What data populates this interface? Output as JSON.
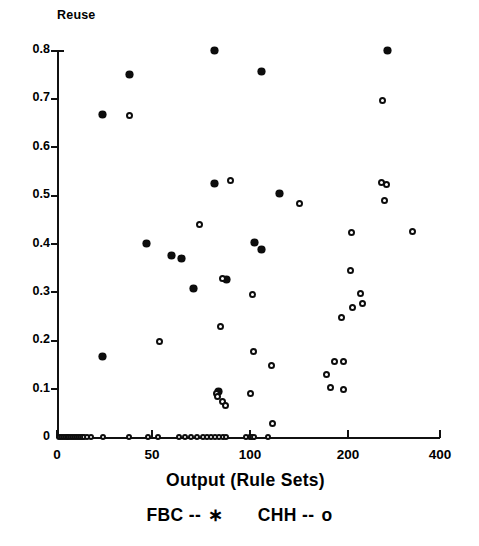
{
  "chart_data": {
    "type": "scatter",
    "title": "",
    "ylabel": "Reuse",
    "xlabel": "Output (Rule Sets)",
    "xticks": [
      0,
      50,
      100,
      200,
      400
    ],
    "xtick_labels": [
      "0",
      "50",
      "100",
      "200",
      "400"
    ],
    "yticks": [
      0,
      0.1,
      0.2,
      0.3,
      0.4,
      0.5,
      0.6,
      0.7,
      0.8
    ],
    "ytick_labels": [
      "0",
      "0.1",
      "0.2",
      "0.3",
      "0.4",
      "0.5",
      "0.6",
      "0.7",
      "0.8"
    ],
    "ylim": [
      0,
      0.8
    ],
    "xlim": [
      0,
      400
    ],
    "xscale": "compressed",
    "grid": false,
    "legend_position": "below-axis",
    "series": [
      {
        "name": "FBC",
        "label": "FBC -- *",
        "marker": "star",
        "marker_symbol": "*",
        "color": "#0d0d0d",
        "points": [
          [
            82,
            0.8
          ],
          [
            285,
            0.8
          ],
          [
            38,
            0.75
          ],
          [
            112,
            0.755
          ],
          [
            24,
            0.667
          ],
          [
            82,
            0.525
          ],
          [
            130,
            0.503
          ],
          [
            47,
            0.4
          ],
          [
            105,
            0.403
          ],
          [
            112,
            0.388
          ],
          [
            60,
            0.375
          ],
          [
            65,
            0.37
          ],
          [
            88,
            0.325
          ],
          [
            71,
            0.307
          ],
          [
            24,
            0.167
          ],
          [
            84,
            0.095
          ]
        ]
      },
      {
        "name": "CHH",
        "label": "CHH -- o",
        "marker": "circle",
        "marker_symbol": "o",
        "color": "#0d0d0d",
        "points": [
          [
            38,
            0.665
          ],
          [
            275,
            0.695
          ],
          [
            90,
            0.53
          ],
          [
            272,
            0.527
          ],
          [
            283,
            0.522
          ],
          [
            150,
            0.483
          ],
          [
            279,
            0.488
          ],
          [
            208,
            0.422
          ],
          [
            340,
            0.424
          ],
          [
            74,
            0.44
          ],
          [
            206,
            0.345
          ],
          [
            86,
            0.328
          ],
          [
            103,
            0.295
          ],
          [
            228,
            0.297
          ],
          [
            209,
            0.267
          ],
          [
            232,
            0.275
          ],
          [
            193,
            0.247
          ],
          [
            85,
            0.228
          ],
          [
            54,
            0.197
          ],
          [
            104,
            0.177
          ],
          [
            122,
            0.147
          ],
          [
            186,
            0.157
          ],
          [
            195,
            0.157
          ],
          [
            178,
            0.13
          ],
          [
            182,
            0.103
          ],
          [
            195,
            0.098
          ],
          [
            100,
            0.09
          ],
          [
            83,
            0.09
          ],
          [
            83.5,
            0.083
          ],
          [
            86,
            0.073
          ],
          [
            87.5,
            0.065
          ],
          [
            123,
            0.028
          ],
          [
            1,
            0
          ],
          [
            2,
            0
          ],
          [
            3,
            0
          ],
          [
            4,
            0
          ],
          [
            5,
            0
          ],
          [
            6,
            0
          ],
          [
            7,
            0
          ],
          [
            8,
            0
          ],
          [
            9,
            0
          ],
          [
            10,
            0
          ],
          [
            11,
            0
          ],
          [
            12,
            0
          ],
          [
            13,
            0
          ],
          [
            14,
            0
          ],
          [
            16,
            0
          ],
          [
            18,
            0
          ],
          [
            24,
            0
          ],
          [
            38,
            0
          ],
          [
            48,
            0
          ],
          [
            53,
            0
          ],
          [
            64,
            0
          ],
          [
            67,
            0
          ],
          [
            70,
            0
          ],
          [
            73,
            0
          ],
          [
            76,
            0
          ],
          [
            78,
            0
          ],
          [
            80,
            0
          ],
          [
            82,
            0
          ],
          [
            84,
            0
          ],
          [
            86,
            0
          ],
          [
            88,
            0
          ],
          [
            98,
            0
          ],
          [
            100,
            0
          ],
          [
            102,
            0
          ],
          [
            104,
            0
          ],
          [
            118,
            0
          ]
        ]
      }
    ]
  },
  "ylabel_text": "Reuse",
  "xlabel_text": "Output (Rule Sets)",
  "legend": {
    "fbc": "FBC  --",
    "fbc_symbol": "∗",
    "chh": "CHH  --",
    "chh_symbol": "o"
  }
}
